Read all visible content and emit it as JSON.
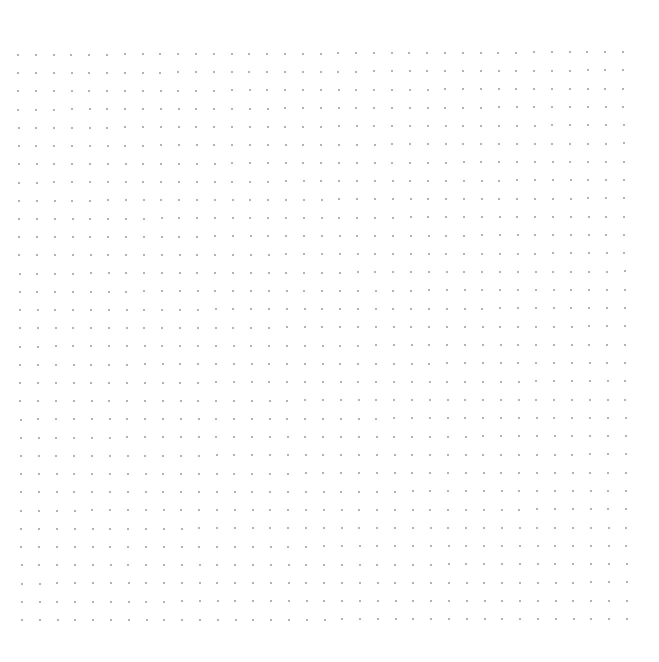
{
  "canvas": {
    "width": 659,
    "height": 662,
    "background": "#ffffff"
  },
  "dot_grid": {
    "columns": 35,
    "rows": 32,
    "top_left": [
      18,
      55
    ],
    "top_right": [
      623,
      52
    ],
    "bottom_left": [
      22,
      620
    ],
    "bottom_right": [
      627,
      619
    ],
    "dot_color": "#9a9a9a",
    "dot_size": 2
  }
}
